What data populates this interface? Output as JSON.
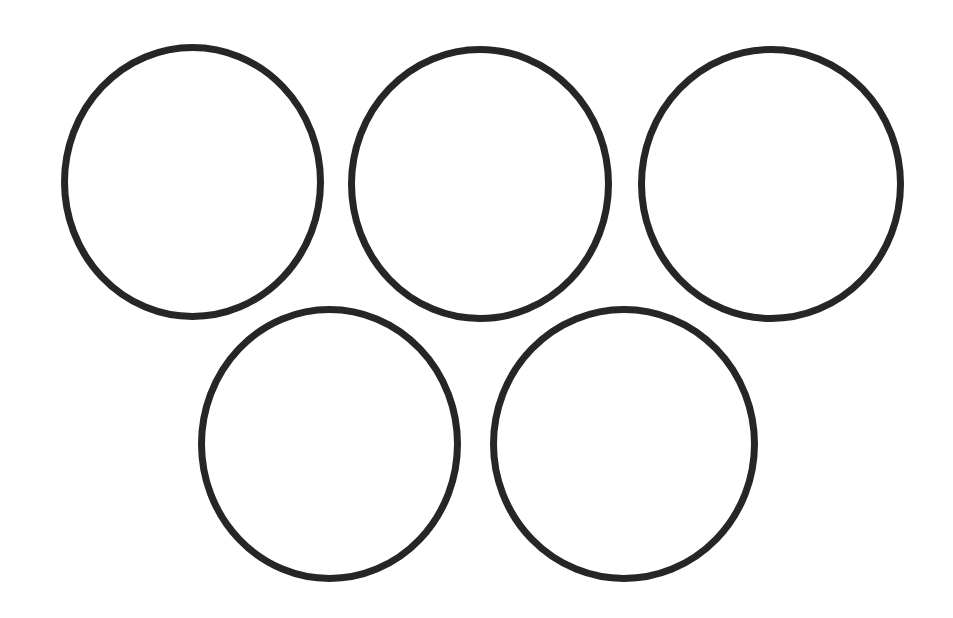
{
  "diagram": {
    "canvas": {
      "width": 953,
      "height": 618,
      "background": "#ffffff"
    },
    "stroke_color": "#262626",
    "stroke_width": 7,
    "rings": [
      {
        "id": "ring-top-left",
        "cx": 192.5,
        "cy": 182,
        "rx": 128,
        "ry": 134.5
      },
      {
        "id": "ring-top-center",
        "cx": 480,
        "cy": 184,
        "rx": 128.5,
        "ry": 134.5
      },
      {
        "id": "ring-top-right",
        "cx": 771,
        "cy": 184,
        "rx": 129.5,
        "ry": 134.5
      },
      {
        "id": "ring-bottom-left",
        "cx": 329.5,
        "cy": 444,
        "rx": 128,
        "ry": 134.5
      },
      {
        "id": "ring-bottom-right",
        "cx": 624,
        "cy": 444,
        "rx": 130.5,
        "ry": 134.5
      }
    ]
  }
}
